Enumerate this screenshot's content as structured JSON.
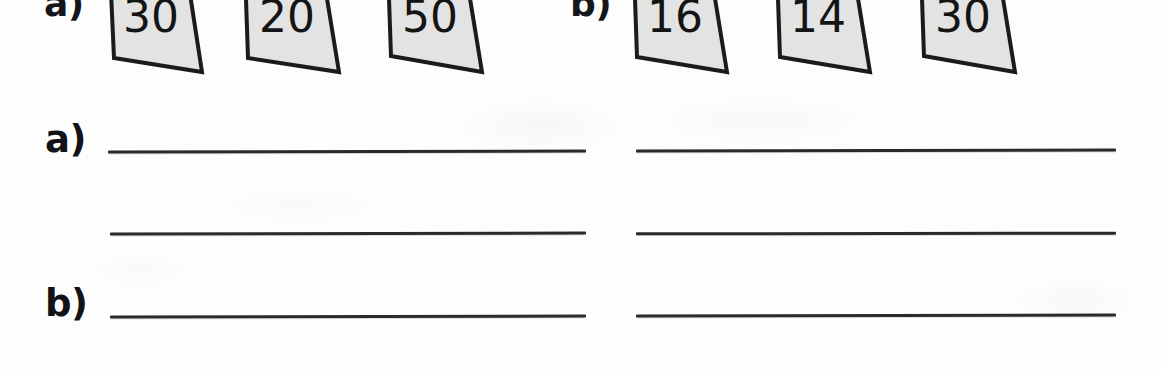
{
  "page": {
    "width": 1161,
    "height": 373,
    "background_color": "#fdfdfd",
    "ink_color": "#1b1b1b",
    "card_fill_color": "#e3e3e3",
    "rule_color": "#2a2a2a"
  },
  "card_rows": [
    {
      "marker": "a)",
      "cards": [
        {
          "value": "30"
        },
        {
          "value": "20"
        },
        {
          "value": "50"
        }
      ]
    },
    {
      "marker": "b)",
      "cards": [
        {
          "value": "16"
        },
        {
          "value": "14"
        },
        {
          "value": "30"
        }
      ]
    }
  ],
  "answer_section": {
    "labels": [
      {
        "text": "a)"
      },
      {
        "text": "b)"
      }
    ],
    "rules": [
      {
        "id": "left-1",
        "value": ""
      },
      {
        "id": "left-2",
        "value": ""
      },
      {
        "id": "left-3",
        "value": ""
      },
      {
        "id": "right-1",
        "value": ""
      },
      {
        "id": "right-2",
        "value": ""
      },
      {
        "id": "right-3",
        "value": ""
      }
    ]
  }
}
